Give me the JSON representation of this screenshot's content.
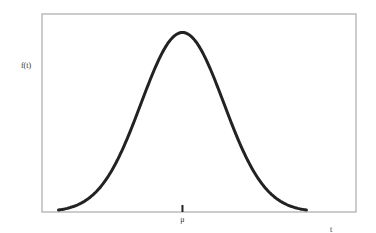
{
  "chart_data": {
    "type": "line",
    "title": "",
    "xlabel": "t",
    "ylabel": "f(t)",
    "distribution": "normal",
    "mean": 0,
    "sd": 1,
    "xlim": [
      -3.4,
      4.2
    ],
    "ylim": [
      0,
      0.44
    ],
    "x_ticks": [
      {
        "value": 0,
        "label": "μ"
      }
    ],
    "y_ticks": [],
    "grid": false,
    "legend": null,
    "series": [
      {
        "name": "f(t)",
        "x": [
          -3.0,
          -2.5,
          -2.0,
          -1.5,
          -1.0,
          -0.5,
          0.0,
          0.5,
          1.0,
          1.5,
          2.0,
          2.5,
          3.0
        ],
        "y": [
          0.0044,
          0.0175,
          0.054,
          0.1295,
          0.242,
          0.3521,
          0.3989,
          0.3521,
          0.242,
          0.1295,
          0.054,
          0.0175,
          0.0044
        ]
      }
    ]
  }
}
